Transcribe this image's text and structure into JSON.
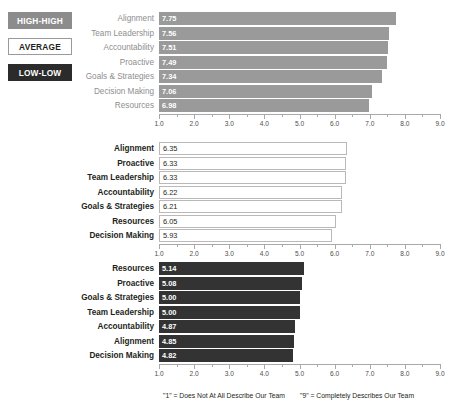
{
  "legend": {
    "items": [
      {
        "label": "HIGH-HIGH",
        "color": "#8c8c8c",
        "text_color": "#ffffff"
      },
      {
        "label": "AVERAGE",
        "color": "#ffffff",
        "text_color": "#231f20"
      },
      {
        "label": "LOW-LOW",
        "color": "#2b2b2b",
        "text_color": "#ffffff"
      }
    ]
  },
  "footnotes": {
    "low": "\"1\" = Does Not At All Describe Our Team",
    "high": "\"9\" = Completely Describes Our Team"
  },
  "axis": {
    "min": 1.0,
    "max": 9.0,
    "tick_labels": [
      "1.0",
      "2.0",
      "3.0",
      "4.0",
      "5.0",
      "6.0",
      "7.0",
      "8.0",
      "9.0"
    ],
    "minor_step": 0.5
  },
  "chart_data": [
    {
      "type": "bar",
      "orientation": "horizontal",
      "name": "HIGH-HIGH",
      "title": "",
      "xlabel": "",
      "ylabel": "",
      "xlim": [
        1.0,
        9.0
      ],
      "grid": false,
      "bar_color": "#9a9a9a",
      "categories": [
        "Alignment",
        "Team Leadership",
        "Accountability",
        "Proactive",
        "Goals & Strategies",
        "Decision Making",
        "Resources"
      ],
      "values": [
        7.75,
        7.56,
        7.51,
        7.49,
        7.34,
        7.06,
        6.98
      ],
      "value_labels": [
        "7.75",
        "7.56",
        "7.51",
        "7.49",
        "7.34",
        "7.06",
        "6.98"
      ]
    },
    {
      "type": "bar",
      "orientation": "horizontal",
      "name": "AVERAGE",
      "title": "",
      "xlabel": "",
      "ylabel": "",
      "xlim": [
        1.0,
        9.0
      ],
      "grid": false,
      "bar_color": "#ffffff",
      "categories": [
        "Alignment",
        "Proactive",
        "Team Leadership",
        "Accountability",
        "Goals & Strategies",
        "Resources",
        "Decision Making"
      ],
      "values": [
        6.35,
        6.33,
        6.33,
        6.22,
        6.21,
        6.05,
        5.93
      ],
      "value_labels": [
        "6.35",
        "6.33",
        "6.33",
        "6.22",
        "6.21",
        "6.05",
        "5.93"
      ]
    },
    {
      "type": "bar",
      "orientation": "horizontal",
      "name": "LOW-LOW",
      "title": "",
      "xlabel": "",
      "ylabel": "",
      "xlim": [
        1.0,
        9.0
      ],
      "grid": false,
      "bar_color": "#333333",
      "categories": [
        "Resources",
        "Proactive",
        "Goals & Strategies",
        "Team Leadership",
        "Accountability",
        "Alignment",
        "Decision Making"
      ],
      "values": [
        5.14,
        5.08,
        5.0,
        5.0,
        4.87,
        4.85,
        4.82
      ],
      "value_labels": [
        "5.14",
        "5.08",
        "5.00",
        "5.00",
        "4.87",
        "4.85",
        "4.82"
      ]
    }
  ]
}
